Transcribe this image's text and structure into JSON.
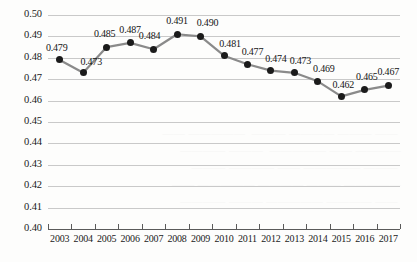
{
  "chart_data": {
    "type": "line",
    "title": "",
    "subtitle": "",
    "xlabel": "",
    "ylabel": "",
    "categories": [
      "2003",
      "2004",
      "2005",
      "2006",
      "2007",
      "2008",
      "2009",
      "2010",
      "2011",
      "2012",
      "2013",
      "2014",
      "2015",
      "2016",
      "2017"
    ],
    "values": [
      0.479,
      0.473,
      0.485,
      0.487,
      0.484,
      0.491,
      0.49,
      0.481,
      0.477,
      0.474,
      0.473,
      0.469,
      0.462,
      0.465,
      0.467
    ],
    "point_labels": [
      "0.479",
      "0.473",
      "0.485",
      "0.487",
      "0.484",
      "0.491",
      "0.490",
      "0.481",
      "0.477",
      "0.474",
      "0.473",
      "0.469",
      "0.462",
      "0.465",
      "0.467"
    ],
    "ylim": [
      0.4,
      0.5
    ],
    "ystep": 0.01,
    "ytick_labels": [
      "0.50",
      "0.49",
      "0.48",
      "0.47",
      "0.46",
      "0.45",
      "0.44",
      "0.43",
      "0.42",
      "0.41",
      "0.40"
    ],
    "ytick_values": [
      0.5,
      0.49,
      0.48,
      0.47,
      0.46,
      0.45,
      0.44,
      0.43,
      0.42,
      0.41,
      0.4
    ],
    "grid": true,
    "grid_axis": "y",
    "legend": false,
    "legend_position": "none",
    "series": [
      {
        "name": "series-1",
        "values": [
          0.479,
          0.473,
          0.485,
          0.487,
          0.484,
          0.491,
          0.49,
          0.481,
          0.477,
          0.474,
          0.473,
          0.469,
          0.462,
          0.465,
          0.467
        ],
        "line_color": "#8a8a8a",
        "marker_color": "#1b1b1b",
        "marker": "circle",
        "data_labels": true
      }
    ]
  },
  "colors": {
    "background": "#fdfdfc",
    "gridline": "#c9c9c9",
    "axis": "#5a5a5a",
    "line": "#8a8a8a",
    "marker": "#1b1b1b",
    "text": "#141414"
  },
  "background_bleed": {
    "text": "\n\n\n\n\n\n\n   —— ——— ———— ———  ————— ——\n  ———— —— —————  ——— ————\n   ——— ————— —— ———— ———\n  ————— ——— ———— ————— ——\n   —— ———— ————— ——— ————\n"
  }
}
